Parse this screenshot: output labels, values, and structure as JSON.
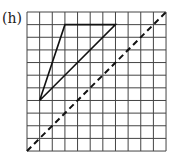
{
  "label": "(h)",
  "grid": {
    "cols": 11,
    "rows": 11,
    "x0": 27,
    "y0": 12,
    "cell": 12.64
  },
  "triangle": {
    "vertices": [
      [
        3,
        1
      ],
      [
        7,
        1
      ],
      [
        1,
        7
      ]
    ]
  },
  "mirror_line": {
    "from": [
      0,
      11
    ],
    "to": [
      11,
      0
    ],
    "style": "dashed"
  },
  "colors": {
    "grid": "#444444",
    "shape": "#111111"
  }
}
